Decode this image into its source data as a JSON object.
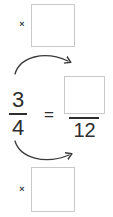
{
  "worksheet": {
    "type": "equivalent-fraction-exercise",
    "statement": "3/4 = ?/12",
    "left_fraction": {
      "numerator": "3",
      "denominator": "4"
    },
    "relation": {
      "equals_symbol": "="
    },
    "right_fraction": {
      "numerator": "",
      "numerator_placeholder": "",
      "denominator": "12"
    },
    "multiplier_top": {
      "operator": "×",
      "value": "",
      "value_placeholder": ""
    },
    "multiplier_bottom": {
      "operator": "×",
      "value": "",
      "value_placeholder": ""
    },
    "arrows": [
      {
        "name": "top-arrow",
        "direction": "left-to-right-over",
        "from": "numerator-3",
        "to": "numerator-box"
      },
      {
        "name": "bottom-arrow",
        "direction": "left-to-right-under",
        "from": "denominator-4",
        "to": "denominator-12"
      }
    ],
    "colors": {
      "ink": "#2e2e2e",
      "box_border": "#c9c9c9",
      "arrow": "#3a3a3a",
      "background": "#ffffff"
    }
  }
}
